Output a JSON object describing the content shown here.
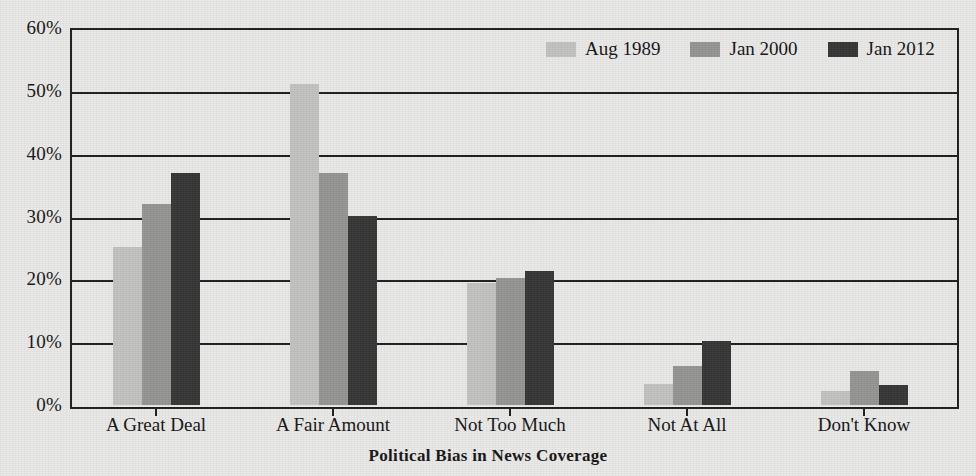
{
  "chart_data": {
    "type": "bar",
    "title": "",
    "xlabel": "Political Bias in News Coverage",
    "ylabel": "",
    "categories": [
      "A Great Deal",
      "A Fair Amount",
      "Not Too Much",
      "Not At All",
      "Don't Know"
    ],
    "series": [
      {
        "name": "Aug 1989",
        "color": "#c3c3c1",
        "values": [
          25.3,
          51.3,
          19.5,
          3.4,
          2.3
        ]
      },
      {
        "name": "Jan 2000",
        "color": "#949492",
        "values": [
          32.2,
          37.2,
          20.3,
          6.3,
          5.4
        ]
      },
      {
        "name": "Jan 2012",
        "color": "#353535",
        "values": [
          37.2,
          30.2,
          21.4,
          10.2,
          3.2
        ]
      }
    ],
    "ylim": [
      0,
      60
    ],
    "y_tick_values": [
      0,
      10,
      20,
      30,
      40,
      50,
      60
    ],
    "y_tick_labels": [
      "0%",
      "10%",
      "20%",
      "30%",
      "40%",
      "50%",
      "60%"
    ],
    "grid": true,
    "legend_position": "top-right",
    "bar_value_unit": "percent"
  },
  "axis": {
    "y_labels": [
      "60%",
      "50%",
      "40%",
      "30%",
      "20%",
      "10%",
      "0%"
    ],
    "x_labels": [
      "A Great Deal",
      "A Fair Amount",
      "Not Too Much",
      "Not At All",
      "Don't Know"
    ],
    "x_title": "Political Bias in News Coverage"
  },
  "legend": {
    "items": [
      {
        "label": "Aug 1989",
        "swatch": "legend-swatch-light"
      },
      {
        "label": "Jan 2000",
        "swatch": "legend-swatch-medium"
      },
      {
        "label": "Jan 2012",
        "swatch": "legend-swatch-dark"
      }
    ]
  },
  "colors": {
    "series_1": "#c3c3c1",
    "series_2": "#949492",
    "series_3": "#353535",
    "axis": "#1d1d1d",
    "background": "#e9e9e7",
    "text": "#141414"
  }
}
